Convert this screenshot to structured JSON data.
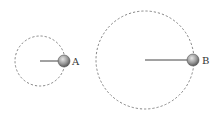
{
  "diagram": {
    "background": "#ffffff",
    "orbits": [
      {
        "id": "A",
        "label": "A",
        "center": [
          40,
          61
        ],
        "radius": 25,
        "ball": [
          64,
          61
        ],
        "ball_radius": 6,
        "label_pos": [
          72,
          65
        ]
      },
      {
        "id": "B",
        "label": "B",
        "center": [
          145,
          60
        ],
        "radius": 49,
        "ball": [
          193,
          60
        ],
        "ball_radius": 6,
        "label_pos": [
          202,
          64
        ]
      }
    ],
    "colors": {
      "orbit": "#777777",
      "rod": "#444444",
      "ball_light": "#d8d8d8",
      "ball_dark": "#6e6e6e",
      "label": "#333333"
    }
  }
}
